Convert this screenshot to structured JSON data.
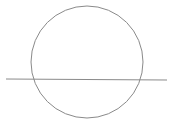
{
  "diagram": {
    "width": 173,
    "height": 136,
    "background": "#ffffff",
    "stroke_color": "#8a8a8a",
    "circle": {
      "cx": 87,
      "cy": 62,
      "r": 56
    },
    "line": {
      "x1": 6,
      "y1": 79,
      "x2": 167,
      "y2": 80
    }
  }
}
